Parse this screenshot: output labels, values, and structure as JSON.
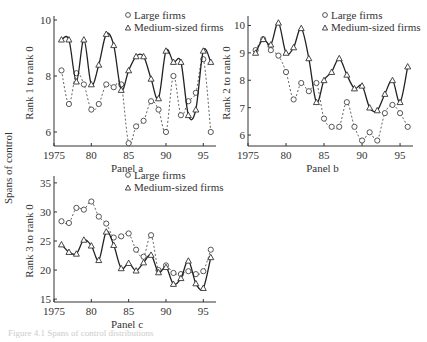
{
  "figure": {
    "shared_ylabel": "Spans of control",
    "caption": "Figure 4.1 Spans of control distributions"
  },
  "legend": {
    "large": "Large firms",
    "medium": "Medium-sized firms"
  },
  "chart_data": [
    {
      "type": "line",
      "title": "Panel a",
      "xlabel": "Panel a",
      "ylabel": "Rank 1 to rank 0",
      "xlim": [
        1975,
        96.5
      ],
      "ylim": [
        5.5,
        10
      ],
      "xticks": [
        "1975",
        "80",
        "85",
        "90",
        "95"
      ],
      "yticks": [
        6,
        8,
        10
      ],
      "x": [
        1976,
        1977,
        1978,
        1979,
        1980,
        1981,
        1982,
        1983,
        1984,
        1985,
        1986,
        1987,
        1988,
        1989,
        1990,
        1991,
        1992,
        1993,
        1994,
        1995,
        1996
      ],
      "series": [
        {
          "name": "Large firms",
          "style": "dotted-circle",
          "values": [
            8.2,
            7.0,
            8.1,
            7.7,
            6.8,
            7.0,
            7.7,
            7.6,
            7.7,
            5.6,
            6.2,
            6.4,
            7.1,
            6.8,
            6.0,
            8.0,
            6.6,
            7.1,
            7.4,
            8.6,
            6.0
          ]
        },
        {
          "name": "Medium-sized firms",
          "style": "solid-triangle",
          "values": [
            9.3,
            9.3,
            7.8,
            9.3,
            7.7,
            8.4,
            9.5,
            9.1,
            7.5,
            8.2,
            8.7,
            8.7,
            7.9,
            7.2,
            8.9,
            8.5,
            8.5,
            6.6,
            6.8,
            8.9,
            8.5
          ]
        }
      ],
      "legend_position": "top-right"
    },
    {
      "type": "line",
      "title": "Panel b",
      "xlabel": "Panel b",
      "ylabel": "Rank 2 to rank 0",
      "xlim": [
        1975,
        96.5
      ],
      "ylim": [
        5.6,
        10.2
      ],
      "xticks": [
        "1975",
        "80",
        "85",
        "90",
        "95"
      ],
      "yticks": [
        6,
        7,
        8,
        9,
        10
      ],
      "x": [
        1976,
        1977,
        1978,
        1979,
        1980,
        1981,
        1982,
        1983,
        1984,
        1985,
        1986,
        1987,
        1988,
        1989,
        1990,
        1991,
        1992,
        1993,
        1994,
        1995,
        1996
      ],
      "series": [
        {
          "name": "Large firms",
          "style": "dotted-circle",
          "values": [
            9.1,
            9.5,
            9.1,
            8.9,
            8.3,
            7.3,
            7.9,
            7.6,
            7.9,
            6.6,
            6.3,
            6.3,
            7.2,
            6.3,
            5.8,
            6.1,
            5.8,
            6.8,
            7.1,
            6.8,
            6.3
          ]
        },
        {
          "name": "Medium-sized firms",
          "style": "solid-triangle",
          "values": [
            9.0,
            9.5,
            9.3,
            10.1,
            9.0,
            9.2,
            9.9,
            8.8,
            7.2,
            8.0,
            8.3,
            8.8,
            8.2,
            7.7,
            7.8,
            7.0,
            6.9,
            7.5,
            8.0,
            7.2,
            8.5
          ]
        }
      ],
      "legend_position": "top-right"
    },
    {
      "type": "line",
      "title": "Panel c",
      "xlabel": "Panel c",
      "ylabel": "Rank 3 to rank 0",
      "xlim": [
        1975,
        96.5
      ],
      "ylim": [
        14.5,
        35.5
      ],
      "xticks": [
        "1975",
        "80",
        "85",
        "90",
        "95"
      ],
      "yticks": [
        15,
        20,
        25,
        30,
        35
      ],
      "x": [
        1976,
        1977,
        1978,
        1979,
        1980,
        1981,
        1982,
        1983,
        1984,
        1985,
        1986,
        1987,
        1988,
        1989,
        1990,
        1991,
        1992,
        1993,
        1994,
        1995,
        1996
      ],
      "series": [
        {
          "name": "Large firms",
          "style": "dotted-circle",
          "values": [
            28.4,
            28.1,
            30.7,
            30.4,
            31.8,
            29.2,
            28.0,
            25.6,
            25.8,
            26.3,
            23.5,
            22.3,
            26.0,
            20.0,
            20.8,
            19.5,
            19.3,
            19.8,
            19.3,
            19.8,
            23.5
          ]
        },
        {
          "name": "Medium-sized firms",
          "style": "solid-triangle",
          "values": [
            24.4,
            23.1,
            22.8,
            25.2,
            24.2,
            21.7,
            26.6,
            24.3,
            20.3,
            21.2,
            19.9,
            21.3,
            22.6,
            19.6,
            20.5,
            17.6,
            18.6,
            21.6,
            17.7,
            16.9,
            22.2
          ]
        }
      ],
      "legend_position": "top-right"
    }
  ]
}
